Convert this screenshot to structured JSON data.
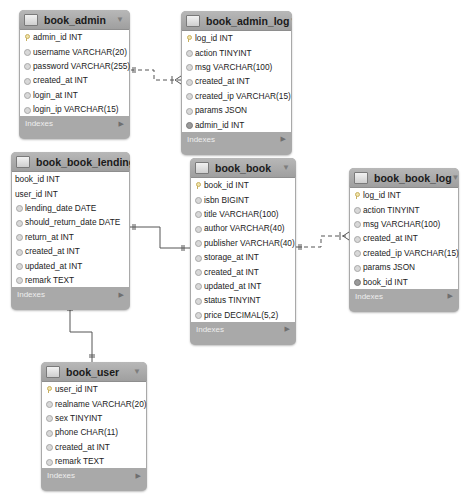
{
  "diagram_title": "EER Diagram",
  "footer_label": "Indexes",
  "tables": {
    "book_admin": {
      "name": "book_admin",
      "columns": [
        {
          "icon": "key",
          "text": "admin_id INT"
        },
        {
          "icon": "dia",
          "text": "username VARCHAR(20)"
        },
        {
          "icon": "dia",
          "text": "password VARCHAR(255)"
        },
        {
          "icon": "dia",
          "text": "created_at INT"
        },
        {
          "icon": "dia",
          "text": "login_at INT"
        },
        {
          "icon": "dia",
          "text": "login_ip VARCHAR(15)"
        }
      ]
    },
    "book_admin_log": {
      "name": "book_admin_log",
      "columns": [
        {
          "icon": "key",
          "text": "log_id INT"
        },
        {
          "icon": "dia",
          "text": "action TINYINT"
        },
        {
          "icon": "dia",
          "text": "msg VARCHAR(100)"
        },
        {
          "icon": "dia",
          "text": "created_at INT"
        },
        {
          "icon": "dia",
          "text": "created_ip VARCHAR(15)"
        },
        {
          "icon": "dia",
          "text": "params JSON"
        },
        {
          "icon": "fk",
          "text": "admin_id INT"
        }
      ]
    },
    "book_book_lending": {
      "name": "book_book_lending",
      "columns": [
        {
          "icon": "none",
          "text": "book_id INT"
        },
        {
          "icon": "none",
          "text": "user_id INT"
        },
        {
          "icon": "dia",
          "text": "lending_date DATE"
        },
        {
          "icon": "dia",
          "text": "should_return_date DATE"
        },
        {
          "icon": "dia",
          "text": "return_at INT"
        },
        {
          "icon": "dia",
          "text": "created_at INT"
        },
        {
          "icon": "dia",
          "text": "updated_at INT"
        },
        {
          "icon": "dia",
          "text": "remark TEXT"
        }
      ]
    },
    "book_book": {
      "name": "book_book",
      "columns": [
        {
          "icon": "key",
          "text": "book_id INT"
        },
        {
          "icon": "dia",
          "text": "isbn BIGINT"
        },
        {
          "icon": "dia",
          "text": "title VARCHAR(100)"
        },
        {
          "icon": "dia",
          "text": "author VARCHAR(40)"
        },
        {
          "icon": "dia",
          "text": "publisher VARCHAR(40)"
        },
        {
          "icon": "dia",
          "text": "storage_at INT"
        },
        {
          "icon": "dia",
          "text": "created_at INT"
        },
        {
          "icon": "dia",
          "text": "updated_at INT"
        },
        {
          "icon": "dia",
          "text": "status TINYINT"
        },
        {
          "icon": "dia",
          "text": "price DECIMAL(5,2)"
        }
      ]
    },
    "book_book_log": {
      "name": "book_book_log",
      "columns": [
        {
          "icon": "key",
          "text": "log_id INT"
        },
        {
          "icon": "dia",
          "text": "action TINYINT"
        },
        {
          "icon": "dia",
          "text": "msg VARCHAR(100)"
        },
        {
          "icon": "dia",
          "text": "created_at INT"
        },
        {
          "icon": "dia",
          "text": "created_ip VARCHAR(15)"
        },
        {
          "icon": "dia",
          "text": "params JSON"
        },
        {
          "icon": "fk",
          "text": "book_id INT"
        }
      ]
    },
    "book_user": {
      "name": "book_user",
      "columns": [
        {
          "icon": "key",
          "text": "user_id INT"
        },
        {
          "icon": "dia",
          "text": "realname VARCHAR(20)"
        },
        {
          "icon": "dia",
          "text": "sex TINYINT"
        },
        {
          "icon": "dia",
          "text": "phone CHAR(11)"
        },
        {
          "icon": "dia",
          "text": "created_at INT"
        },
        {
          "icon": "dia",
          "text": "remark TEXT"
        }
      ]
    }
  },
  "relationships": [
    {
      "from": "book_admin",
      "to": "book_admin_log",
      "style": "dashed",
      "cardinality": "one-to-many"
    },
    {
      "from": "book_book_lending",
      "to": "book_book",
      "style": "solid",
      "cardinality": "one-to-one"
    },
    {
      "from": "book_book",
      "to": "book_book_log",
      "style": "dashed",
      "cardinality": "one-to-many"
    },
    {
      "from": "book_book_lending",
      "to": "book_user",
      "style": "solid",
      "cardinality": "one-to-one"
    }
  ],
  "colors": {
    "table_frame": "#a9a9a9",
    "table_header": "#a8a8a8",
    "row_bg": "#ffffff",
    "line": "#555555",
    "footer_text": "#eeeeee"
  }
}
